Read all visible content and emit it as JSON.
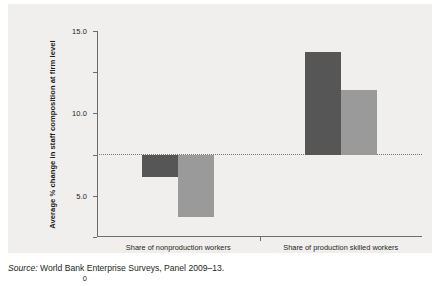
{
  "chart_data": {
    "type": "bar",
    "title": "",
    "subtitle": "",
    "xlabel": "",
    "ylabel": "Average % change in staff composition at firm level",
    "ylim": [
      -10.0,
      15.0
    ],
    "ytick_labels": [
      "15.0",
      "10.0",
      "5.0",
      "0",
      "−5.0",
      "−10.0"
    ],
    "ytick_values": [
      15.0,
      10.0,
      5.0,
      0,
      -5.0,
      -10.0
    ],
    "grid": false,
    "legend": "none",
    "zero_reference_line": true,
    "categories": [
      "Share of nonproduction workers",
      "Share of production skilled workers"
    ],
    "series": [
      {
        "name": "series-1",
        "color": "#565656",
        "values": [
          -2.7,
          12.4
        ]
      },
      {
        "name": "series-2",
        "color": "#9a9a9a",
        "values": [
          -7.6,
          7.9
        ]
      }
    ]
  },
  "source": {
    "label": "Source:",
    "text": " World Bank Enterprise Surveys, Panel 2009–13."
  },
  "colors": {
    "panel_background": "#f0efee",
    "series_dark": "#565656",
    "series_light": "#9a9a9a",
    "axis": "#6d6d6d",
    "text": "#231f20"
  }
}
